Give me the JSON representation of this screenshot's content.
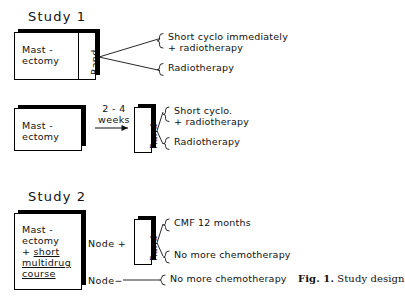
{
  "figure": {
    "caption_prefix": "Fig. 1.",
    "caption_text": "Study design",
    "background": "#ffffff",
    "ink": "#111111"
  },
  "study1": {
    "title": "Study 1",
    "arm_a": {
      "box_line1": "Mast -",
      "box_line2": "ectomy",
      "rand_label": "Rand",
      "outcomes": [
        {
          "line1": "Short cyclo immediately",
          "line2": "+ radiotherapy"
        },
        {
          "line1": "Radiotherapy",
          "line2": ""
        }
      ]
    },
    "arm_b": {
      "box_line1": "Mast -",
      "box_line2": "ectomy",
      "interval_line1": "2 - 4",
      "interval_line2": "weeks",
      "rand_label": "Rand",
      "outcomes": [
        {
          "line1": "Short cyclo.",
          "line2": "+ radiotherapy"
        },
        {
          "line1": "Radiotherapy",
          "line2": ""
        }
      ]
    }
  },
  "study2": {
    "title": "Study 2",
    "box_line1": "Mast -",
    "box_line2": "ectomy",
    "box_line3_plus": "+ ",
    "box_line3": "short",
    "box_line4": "multidrug",
    "box_line5": "course",
    "node_positive_label": "Node +",
    "node_negative_label": "Node−",
    "rand_label": "Rand",
    "node_positive_outcomes": [
      "CMF  12 months",
      "No more chemotherapy"
    ],
    "node_negative_outcome": "No more chemotherapy"
  }
}
